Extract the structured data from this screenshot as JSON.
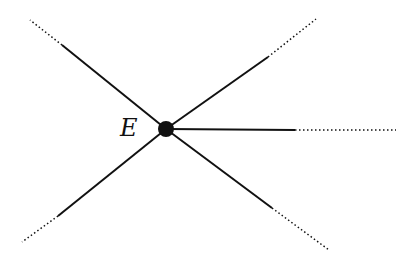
{
  "diagram": {
    "vertex": {
      "label": "E",
      "x": 166,
      "y": 129,
      "r": 8
    },
    "edges": [
      {
        "name": "upper-left",
        "solid_end": [
          62,
          45
        ],
        "dotted_end": [
          30,
          20
        ]
      },
      {
        "name": "upper-right",
        "solid_end": [
          268,
          57
        ],
        "dotted_end": [
          316,
          19
        ]
      },
      {
        "name": "right",
        "solid_end": [
          295,
          130
        ],
        "dotted_end": [
          396,
          130
        ]
      },
      {
        "name": "lower-left",
        "solid_end": [
          58,
          216
        ],
        "dotted_end": [
          22,
          242
        ]
      },
      {
        "name": "lower-right",
        "solid_end": [
          272,
          208
        ],
        "dotted_end": [
          329,
          250
        ]
      }
    ],
    "colors": {
      "line": "#111111",
      "background": "#ffffff"
    }
  }
}
